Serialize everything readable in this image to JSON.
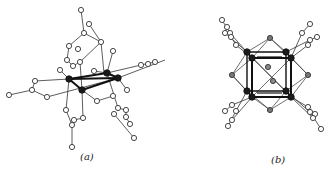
{
  "figure": {
    "panels": [
      {
        "id": "a",
        "caption": "(a)",
        "colors": {
          "line": "#333333",
          "open_atom_fill": "#ffffff",
          "metal_atom_fill": "#1a1a1a"
        },
        "metal_atoms": [
          [
            69,
            79
          ],
          [
            107,
            73
          ],
          [
            118,
            78
          ],
          [
            82,
            90
          ]
        ],
        "metal_bonds": [
          [
            0,
            1
          ],
          [
            1,
            2
          ],
          [
            2,
            3
          ],
          [
            3,
            0
          ],
          [
            0,
            2
          ]
        ],
        "open_atoms": [
          [
            81,
            10
          ],
          [
            89,
            24
          ],
          [
            84,
            33
          ],
          [
            101,
            42
          ],
          [
            69,
            46
          ],
          [
            78,
            49
          ],
          [
            113,
            51
          ],
          [
            67,
            60
          ],
          [
            73,
            66
          ],
          [
            80,
            62
          ],
          [
            60,
            70
          ],
          [
            94,
            71
          ],
          [
            35,
            81
          ],
          [
            32,
            90
          ],
          [
            9,
            95
          ],
          [
            47,
            97
          ],
          [
            97,
            101
          ],
          [
            113,
            96
          ],
          [
            127,
            90
          ],
          [
            141,
            65
          ],
          [
            148,
            64
          ],
          [
            155,
            62
          ],
          [
            66,
            110
          ],
          [
            72,
            125
          ],
          [
            74,
            120
          ],
          [
            83,
            118
          ],
          [
            118,
            108
          ],
          [
            114,
            114
          ],
          [
            126,
            110
          ],
          [
            126,
            117
          ],
          [
            130,
            124
          ],
          [
            134,
            138
          ],
          [
            72,
            147
          ]
        ],
        "bonds": [
          [
            [
              81,
              10
            ],
            [
              84,
              33
            ]
          ],
          [
            [
              89,
              24
            ],
            [
              101,
              42
            ]
          ],
          [
            [
              84,
              33
            ],
            [
              69,
              46
            ]
          ],
          [
            [
              84,
              33
            ],
            [
              101,
              42
            ]
          ],
          [
            [
              101,
              42
            ],
            [
              80,
              62
            ]
          ],
          [
            [
              113,
              51
            ],
            [
              107,
              73
            ]
          ],
          [
            [
              69,
              46
            ],
            [
              67,
              60
            ]
          ],
          [
            [
              67,
              60
            ],
            [
              73,
              66
            ]
          ],
          [
            [
              73,
              66
            ],
            [
              80,
              62
            ]
          ],
          [
            [
              80,
              62
            ],
            [
              82,
              90
            ]
          ],
          [
            [
              60,
              70
            ],
            [
              69,
              79
            ]
          ],
          [
            [
              94,
              71
            ],
            [
              107,
              73
            ]
          ],
          [
            [
              69,
              79
            ],
            [
              35,
              81
            ]
          ],
          [
            [
              35,
              81
            ],
            [
              32,
              90
            ]
          ],
          [
            [
              32,
              90
            ],
            [
              9,
              95
            ]
          ],
          [
            [
              32,
              90
            ],
            [
              47,
              97
            ]
          ],
          [
            [
              47,
              97
            ],
            [
              118,
              78
            ]
          ],
          [
            [
              82,
              90
            ],
            [
              97,
              101
            ]
          ],
          [
            [
              97,
              101
            ],
            [
              113,
              96
            ]
          ],
          [
            [
              118,
              78
            ],
            [
              127,
              90
            ]
          ],
          [
            [
              118,
              78
            ],
            [
              165,
              60
            ]
          ],
          [
            [
              107,
              73
            ],
            [
              141,
              65
            ]
          ],
          [
            [
              141,
              65
            ],
            [
              155,
              62
            ]
          ],
          [
            [
              69,
              79
            ],
            [
              66,
              110
            ]
          ],
          [
            [
              66,
              110
            ],
            [
              72,
              125
            ]
          ],
          [
            [
              72,
              125
            ],
            [
              74,
              120
            ]
          ],
          [
            [
              74,
              120
            ],
            [
              83,
              118
            ]
          ],
          [
            [
              82,
              90
            ],
            [
              83,
              118
            ]
          ],
          [
            [
              72,
              125
            ],
            [
              72,
              147
            ]
          ],
          [
            [
              107,
              73
            ],
            [
              118,
              108
            ]
          ],
          [
            [
              118,
              108
            ],
            [
              126,
              110
            ]
          ],
          [
            [
              126,
              110
            ],
            [
              126,
              117
            ]
          ],
          [
            [
              126,
              117
            ],
            [
              130,
              124
            ]
          ],
          [
            [
              114,
              114
            ],
            [
              134,
              138
            ]
          ],
          [
            [
              101,
              42
            ],
            [
              104,
              73
            ]
          ]
        ]
      },
      {
        "id": "b",
        "caption": "(b)",
        "colors": {
          "line": "#333333",
          "open_atom_fill": "#ffffff",
          "metal_atom_fill": "#1a1a1a",
          "inner_atom_fill": "#888888"
        },
        "cube_front": [
          [
            87,
            58
          ],
          [
            126,
            58
          ],
          [
            126,
            97
          ],
          [
            87,
            97
          ]
        ],
        "cube_back": [
          [
            82,
            52
          ],
          [
            121,
            52
          ],
          [
            121,
            91
          ],
          [
            82,
            91
          ]
        ],
        "octa": [
          [
            105,
            38
          ],
          [
            143,
            75
          ],
          [
            105,
            110
          ],
          [
            67,
            75
          ]
        ],
        "inner_atoms": [
          [
            103,
            67
          ],
          [
            108,
            81
          ]
        ],
        "ligand_chains": [
          [
            [
              87,
              58
            ],
            [
              65,
              33
            ],
            [
              57,
              20
            ]
          ],
          [
            [
              82,
              52
            ],
            [
              60,
              33
            ],
            [
              62,
              27
            ]
          ],
          [
            [
              87,
              58
            ],
            [
              71,
              45
            ],
            [
              66,
              37
            ]
          ],
          [
            [
              126,
              58
            ],
            [
              137,
              33
            ],
            [
              145,
              24
            ]
          ],
          [
            [
              121,
              52
            ],
            [
              145,
              40
            ],
            [
              152,
              37
            ]
          ],
          [
            [
              126,
              58
            ],
            [
              143,
              45
            ]
          ],
          [
            [
              87,
              97
            ],
            [
              67,
              105
            ],
            [
              60,
              111
            ]
          ],
          [
            [
              82,
              91
            ],
            [
              71,
              111
            ],
            [
              63,
              126
            ]
          ],
          [
            [
              87,
              97
            ],
            [
              67,
              120
            ]
          ],
          [
            [
              126,
              97
            ],
            [
              143,
              107
            ],
            [
              150,
              114
            ]
          ],
          [
            [
              121,
              91
            ],
            [
              145,
              112
            ],
            [
              156,
              129
            ]
          ],
          [
            [
              126,
              97
            ],
            [
              148,
              118
            ]
          ]
        ]
      }
    ]
  }
}
